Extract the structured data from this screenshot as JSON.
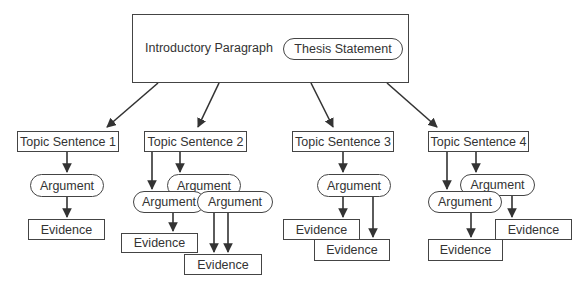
{
  "diagram": {
    "title": "",
    "intro": {
      "label": "Introductory Paragraph",
      "thesis": "Thesis Statement"
    },
    "topics": [
      {
        "label": "Topic Sentence 1",
        "arguments": [
          "Argument"
        ],
        "evidence": [
          "Evidence"
        ]
      },
      {
        "label": "Topic Sentence 2",
        "arguments": [
          "Argument",
          "Argument",
          "Argument"
        ],
        "evidence": [
          "Evidence",
          "Evidence"
        ]
      },
      {
        "label": "Topic Sentence 3",
        "arguments": [
          "Argument"
        ],
        "evidence": [
          "Evidence",
          "Evidence"
        ]
      },
      {
        "label": "Topic Sentence 4",
        "arguments": [
          "Argument",
          "Argument"
        ],
        "evidence": [
          "Evidence",
          "Evidence"
        ]
      }
    ],
    "colors": {
      "stroke": "#444444",
      "text": "#333333",
      "background": "#ffffff"
    }
  }
}
